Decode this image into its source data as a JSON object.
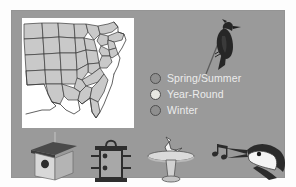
{
  "panel": {
    "background_color": "#9a9a9a",
    "border_color": "#949494"
  },
  "map": {
    "name": "us-range-map",
    "background_color": "#ffffff",
    "shaded_color": "#c9c9c9",
    "outline_color": "#3a3a3a",
    "description": "Range map of the United States with the eastern and central states shaded"
  },
  "bird": {
    "name": "woodpecker-illustration",
    "label": "Woodpecker on branch",
    "body_color": "#2b2b2b"
  },
  "legend": {
    "items": [
      {
        "label": "Spring/Summer",
        "color": "#8f8f8f",
        "icon": "circle-swatch-icon"
      },
      {
        "label": "Year-Round",
        "color": "#e8e8e2",
        "icon": "circle-swatch-icon"
      },
      {
        "label": "Winter",
        "color": "#8f8f8f",
        "icon": "circle-swatch-icon"
      }
    ],
    "text_color": "#ececec"
  },
  "icons": [
    {
      "name": "birdhouse-icon",
      "label": "Birdhouse"
    },
    {
      "name": "bird-feeder-icon",
      "label": "Bird feeder"
    },
    {
      "name": "birdbath-icon",
      "label": "Birdbath"
    },
    {
      "name": "singing-bird-head-icon",
      "label": "Singing bird with music notes"
    }
  ]
}
